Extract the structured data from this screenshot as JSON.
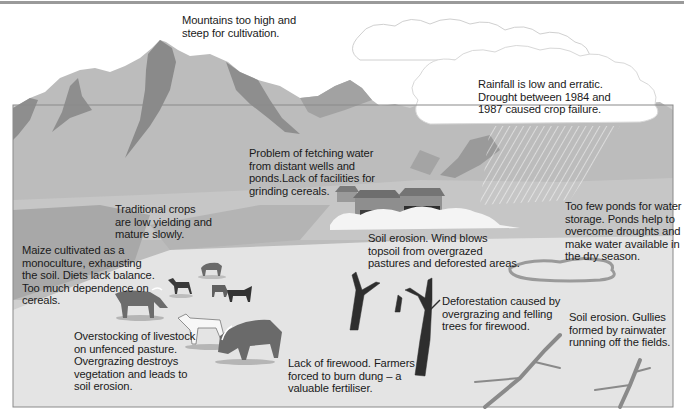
{
  "diagram": {
    "type": "illustrated-landscape",
    "theme": "Causes of land degradation and food insecurity in a rural highland area",
    "colors": {
      "mountain_light": "#b9b9b9",
      "mountain_dark": "#8c8c8c",
      "plain": "#d9d9d9",
      "foreground": "#e6e6e6",
      "cloud": "#ffffff",
      "frame_border": "#8a8a8a",
      "text": "#1a1a1a"
    },
    "annotations": [
      {
        "id": "mountains",
        "text": "Mountains too high and\nsteep for cultivation."
      },
      {
        "id": "rainfall",
        "text": "Rainfall is low and erratic.\nDrought between 1984 and\n1987 caused crop failure."
      },
      {
        "id": "water",
        "text": "Problem of fetching water\nfrom distant wells and\nponds.Lack of facilities for\ngrinding cereals."
      },
      {
        "id": "crops",
        "text": "Traditional crops\nare low yielding and\nmature slowly."
      },
      {
        "id": "maize",
        "text": "Maize cultivated as a\nmonoculture, exhausting\nthe soil. Diets lack balance.\nToo much dependence on\ncereals."
      },
      {
        "id": "ponds",
        "text": "Too few ponds for water\nstorage. Ponds help to\novercome droughts and\nmake water available in\nthe dry season."
      },
      {
        "id": "wind-erosion",
        "text": "Soil erosion. Wind blows\ntopsoil from overgrazed\npastures and deforested areas."
      },
      {
        "id": "overstocking",
        "text": "Overstocking of livestock\non unfenced pasture.\nOvergrazing destroys\nvegetation and leads to\nsoil erosion."
      },
      {
        "id": "deforestation",
        "text": "Deforestation caused by\novergrazing and felling\ntrees for firewood."
      },
      {
        "id": "gullies",
        "text": "Soil erosion. Gullies\nformed by rainwater\nrunning off the fields."
      },
      {
        "id": "firewood",
        "text": "Lack of firewood. Farmers\nforced to burn dung – a\nvaluable fertiliser."
      }
    ],
    "elements": [
      "mountains",
      "rain-cloud",
      "rain-streaks",
      "village-houses",
      "dust-cloud",
      "pond",
      "cattle",
      "goats",
      "dead-trees",
      "gully-branches"
    ]
  }
}
